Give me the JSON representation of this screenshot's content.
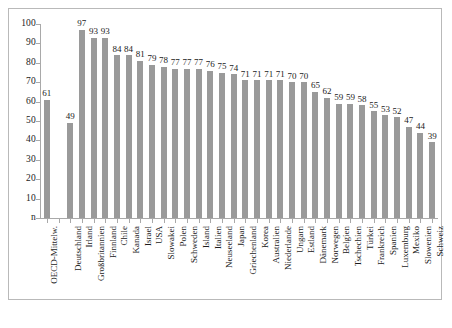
{
  "chart_data": {
    "type": "bar",
    "title": "",
    "subtitle": "",
    "xlabel": "",
    "ylabel": "",
    "ylim": [
      0,
      100
    ],
    "yticks": [
      "n",
      "10",
      "20",
      "30",
      "40",
      "50",
      "60",
      "70",
      "80",
      "90",
      "100"
    ],
    "ytick_values": [
      0,
      10,
      20,
      30,
      40,
      50,
      60,
      70,
      80,
      90,
      100
    ],
    "grid": false,
    "legend": "none",
    "bar_color": "#9a9a9a",
    "axis_color": "#a9a9a9",
    "text_color": "#1b1b1b",
    "gap_after_index": 0,
    "categories": [
      "OECD-Mittelw.",
      "Deutschland",
      "Irland",
      "Großbritannien",
      "Finnland",
      "Chile",
      "Kanada",
      "Israel",
      "USA",
      "Slowakei",
      "Polen",
      "Schweden",
      "Island",
      "Italien",
      "Neuseeland",
      "Japan",
      "Griechenland",
      "Korea",
      "Australien",
      "Niederlande",
      "Ungarn",
      "Estland",
      "Dänemark",
      "Norwegen",
      "Belgien",
      "Tschechien",
      "Türkei",
      "Frankreich",
      "Spanien",
      "Luxemburg",
      "Mexiko",
      "Slowenien",
      "Schweiz"
    ],
    "values": [
      61,
      49,
      97,
      93,
      93,
      84,
      84,
      81,
      79,
      78,
      77,
      77,
      77,
      76,
      75,
      74,
      71,
      71,
      71,
      71,
      70,
      70,
      65,
      62,
      59,
      59,
      58,
      55,
      53,
      52,
      47,
      44,
      39
    ],
    "value_labels": [
      "61",
      "49",
      "97",
      "93",
      "93",
      "84",
      "84",
      "81",
      "79",
      "78",
      "77",
      "77",
      "77",
      "76",
      "75",
      "74",
      "71",
      "71",
      "71",
      "71",
      "70",
      "70",
      "65",
      "62",
      "59",
      "59",
      "58",
      "55",
      "53",
      "52",
      "47",
      "44",
      "39"
    ]
  }
}
